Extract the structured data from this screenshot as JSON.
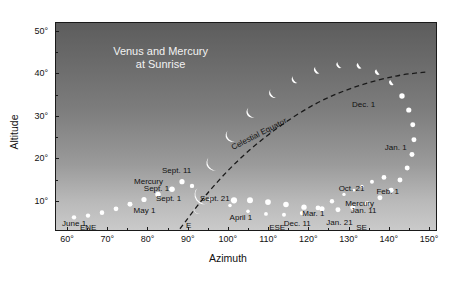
{
  "figure": {
    "title_line1": "Venus and Mercury",
    "title_line2": "at Sunrise",
    "xlabel": "Azimuth",
    "ylabel": "Altitude"
  },
  "chart_data": {
    "type": "scatter",
    "xlabel": "Azimuth",
    "ylabel": "Altitude",
    "xlim": [
      57,
      152
    ],
    "ylim": [
      3,
      52
    ],
    "grid": false,
    "legend": "none",
    "xticks": [
      "60°",
      "70°",
      "80°",
      "90°",
      "100°",
      "110°",
      "120°",
      "130°",
      "140°",
      "150°"
    ],
    "xtick_values": [
      60,
      70,
      80,
      90,
      100,
      110,
      120,
      130,
      140,
      150
    ],
    "yticks": [
      "10°",
      "20°",
      "30°",
      "40°",
      "50°"
    ],
    "ytick_values": [
      10,
      20,
      30,
      40,
      50
    ],
    "series": [
      {
        "name": "Venus",
        "marker": "crescent-and-disk",
        "points": [
          {
            "x": 92.5,
            "y": 8.0,
            "size": 4.0,
            "phase": 0.1,
            "label": null
          },
          {
            "x": 94.0,
            "y": 11.5,
            "size": 9.5,
            "phase": 0.12,
            "label": "Sept. 21"
          },
          {
            "x": 96.5,
            "y": 19.0,
            "size": 7.6,
            "phase": 0.18,
            "label": null
          },
          {
            "x": 101.0,
            "y": 25.5,
            "size": 6.4,
            "phase": 0.24,
            "label": null
          },
          {
            "x": 106.0,
            "y": 31.0,
            "size": 5.6,
            "phase": 0.3,
            "label": null
          },
          {
            "x": 111.5,
            "y": 35.5,
            "size": 4.9,
            "phase": 0.36,
            "label": null
          },
          {
            "x": 117.0,
            "y": 38.8,
            "size": 4.3,
            "phase": 0.42,
            "label": null
          },
          {
            "x": 122.5,
            "y": 41.0,
            "size": 3.9,
            "phase": 0.48,
            "label": null
          },
          {
            "x": 128.0,
            "y": 42.2,
            "size": 3.5,
            "phase": 0.56,
            "label": null
          },
          {
            "x": 133.0,
            "y": 42.0,
            "size": 3.2,
            "phase": 0.7,
            "label": "Dec. 1"
          },
          {
            "x": 137.5,
            "y": 40.5,
            "size": 3.0,
            "phase": 0.86,
            "label": null
          },
          {
            "x": 141.0,
            "y": 38.0,
            "size": 2.8,
            "phase": 0.95,
            "label": null
          },
          {
            "x": 143.5,
            "y": 34.8,
            "size": 2.7,
            "phase": 1.0,
            "label": null
          },
          {
            "x": 145.2,
            "y": 31.5,
            "size": 2.6,
            "phase": 1.0,
            "label": null
          },
          {
            "x": 146.2,
            "y": 28.0,
            "size": 2.5,
            "phase": 1.0,
            "label": "Jan. 1"
          },
          {
            "x": 146.5,
            "y": 24.5,
            "size": 2.5,
            "phase": 1.0,
            "label": null
          },
          {
            "x": 146.0,
            "y": 21.0,
            "size": 2.5,
            "phase": 1.0,
            "label": null
          },
          {
            "x": 144.8,
            "y": 17.8,
            "size": 2.5,
            "phase": 1.0,
            "label": null
          },
          {
            "x": 143.0,
            "y": 15.0,
            "size": 2.5,
            "phase": 1.0,
            "label": "Feb. 1"
          },
          {
            "x": 140.8,
            "y": 12.6,
            "size": 2.5,
            "phase": 1.0,
            "label": null
          },
          {
            "x": 138.0,
            "y": 10.8,
            "size": 2.5,
            "phase": 1.0,
            "label": null
          },
          {
            "x": 134.8,
            "y": 9.4,
            "size": 2.5,
            "phase": 1.0,
            "label": null
          },
          {
            "x": 131.2,
            "y": 8.5,
            "size": 2.5,
            "phase": 1.0,
            "label": null
          },
          {
            "x": 127.5,
            "y": 8.0,
            "size": 2.5,
            "phase": 1.0,
            "label": null
          },
          {
            "x": 123.5,
            "y": 8.2,
            "size": 2.6,
            "phase": 1.0,
            "label": "Mar. 1"
          },
          {
            "x": 119.0,
            "y": 8.6,
            "size": 2.7,
            "phase": 1.0,
            "label": null
          },
          {
            "x": 114.5,
            "y": 9.2,
            "size": 2.8,
            "phase": 1.0,
            "label": null
          },
          {
            "x": 110.0,
            "y": 9.8,
            "size": 2.9,
            "phase": 1.0,
            "label": null
          },
          {
            "x": 105.5,
            "y": 10.2,
            "size": 3.0,
            "phase": 1.0,
            "label": null
          },
          {
            "x": 101.5,
            "y": 10.2,
            "size": 3.1,
            "phase": 1.0,
            "label": "April 1"
          }
        ]
      },
      {
        "name": "Mercury",
        "marker": "disk",
        "points": [
          {
            "x": 61.5,
            "y": 6.2,
            "size": 2.2,
            "label": "June 1"
          },
          {
            "x": 65.0,
            "y": 6.6,
            "size": 2.2,
            "label": null
          },
          {
            "x": 68.5,
            "y": 7.3,
            "size": 2.3,
            "label": null
          },
          {
            "x": 72.0,
            "y": 8.2,
            "size": 2.4,
            "label": "May 1"
          },
          {
            "x": 75.5,
            "y": 9.3,
            "size": 2.5,
            "label": null
          },
          {
            "x": 79.0,
            "y": 10.4,
            "size": 2.6,
            "label": null
          },
          {
            "x": 82.5,
            "y": 11.6,
            "size": 2.7,
            "label": "Sept. 1"
          },
          {
            "x": 86.0,
            "y": 12.8,
            "size": 2.8,
            "label": "Sept. 1"
          },
          {
            "x": 88.5,
            "y": 14.6,
            "size": 2.6,
            "label": "Sept. 11"
          },
          {
            "x": 91.0,
            "y": 13.6,
            "size": 2.2,
            "label": null
          },
          {
            "x": 95.5,
            "y": 10.5,
            "size": 1.9,
            "label": null
          },
          {
            "x": 100.5,
            "y": 9.0,
            "size": 1.8,
            "label": null
          },
          {
            "x": 105.0,
            "y": 7.6,
            "size": 1.8,
            "label": null
          },
          {
            "x": 109.5,
            "y": 7.0,
            "size": 1.9,
            "label": null
          },
          {
            "x": 114.0,
            "y": 6.8,
            "size": 2.0,
            "label": null
          },
          {
            "x": 118.5,
            "y": 7.2,
            "size": 2.2,
            "label": "Dec. 11"
          },
          {
            "x": 122.5,
            "y": 8.4,
            "size": 2.4,
            "label": null
          },
          {
            "x": 126.0,
            "y": 10.0,
            "size": 2.2,
            "label": null
          },
          {
            "x": 129.0,
            "y": 11.6,
            "size": 1.7,
            "label": "Jan. 21"
          },
          {
            "x": 131.5,
            "y": 12.6,
            "size": 1.4,
            "label": "Jan. 11"
          },
          {
            "x": 133.5,
            "y": 13.5,
            "size": 1.6,
            "label": null
          },
          {
            "x": 136.0,
            "y": 14.6,
            "size": 2.0,
            "label": "Oct. 21"
          },
          {
            "x": 139.0,
            "y": 15.6,
            "size": 2.4,
            "label": null
          }
        ]
      }
    ],
    "annotations": [
      {
        "text": "Venus and Mercury",
        "x": 83,
        "y": 45.5,
        "color": "#f4f4f4"
      },
      {
        "text": "at Sunrise",
        "x": 83,
        "y": 42.5,
        "color": "#f4f4f4"
      },
      {
        "text": "Celestial Equator",
        "x": 107.5,
        "y": 26.0,
        "rotate": -27,
        "color": "#111111"
      },
      {
        "text": "Mercury",
        "x": 80.0,
        "y": 15.0,
        "color": "#111111"
      },
      {
        "text": "Mercury",
        "x": 132.5,
        "y": 9.8,
        "color": "#111111"
      },
      {
        "text": "Sept. 11",
        "x": 87.0,
        "y": 17.6,
        "color": "#111111"
      },
      {
        "text": "Sept. 1",
        "x": 82.0,
        "y": 13.2,
        "color": "#111111"
      },
      {
        "text": "Sept. 1",
        "x": 85.0,
        "y": 11.0,
        "color": "#111111"
      },
      {
        "text": "Sept. 21",
        "x": 96.5,
        "y": 11.0,
        "color": "#111111"
      },
      {
        "text": "May 1",
        "x": 79.0,
        "y": 8.2,
        "color": "#111111"
      },
      {
        "text": "June 1",
        "x": 61.5,
        "y": 5.2,
        "color": "#111111"
      },
      {
        "text": "April 1",
        "x": 103.0,
        "y": 6.4,
        "color": "#111111"
      },
      {
        "text": "Dec. 11",
        "x": 117.0,
        "y": 5.2,
        "color": "#111111"
      },
      {
        "text": "Mar. 1",
        "x": 121.0,
        "y": 7.4,
        "color": "#111111"
      },
      {
        "text": "Jan. 21",
        "x": 127.5,
        "y": 5.4,
        "color": "#111111"
      },
      {
        "text": "Jan. 11",
        "x": 133.5,
        "y": 8.2,
        "color": "#111111"
      },
      {
        "text": "Oct. 21",
        "x": 130.5,
        "y": 13.4,
        "color": "#111111"
      },
      {
        "text": "Feb. 1",
        "x": 139.5,
        "y": 12.6,
        "color": "#111111"
      },
      {
        "text": "Dec. 1",
        "x": 133.5,
        "y": 33.0,
        "color": "#111111"
      },
      {
        "text": "Jan. 1",
        "x": 141.5,
        "y": 23.0,
        "color": "#111111"
      }
    ],
    "compass_directions": [
      {
        "text": "ENE",
        "x": 65.0,
        "y": 4.2
      },
      {
        "text": "E",
        "x": 90.0,
        "y": 4.6
      },
      {
        "text": "ESE",
        "x": 112.0,
        "y": 4.2
      },
      {
        "text": "SE",
        "x": 133.0,
        "y": 4.2
      }
    ],
    "celestial_equator": {
      "style": "dashed",
      "color": "#1a1a1a",
      "points": [
        [
          88,
          3.5
        ],
        [
          95,
          12
        ],
        [
          103,
          20
        ],
        [
          112,
          27
        ],
        [
          122,
          33
        ],
        [
          132,
          37
        ],
        [
          142,
          39.5
        ],
        [
          150,
          40.5
        ]
      ]
    }
  },
  "colors": {
    "sky_top": "#5d5d5d",
    "sky_bottom": "#cacaca",
    "planet": "#ffffff",
    "axis": "#1a1a1a",
    "text_dark": "#111111",
    "text_light": "#f4f4f4"
  }
}
